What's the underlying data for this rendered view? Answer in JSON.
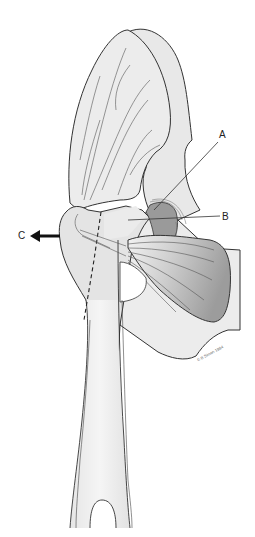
{
  "figure": {
    "labels": [
      {
        "id": "A",
        "text": "A",
        "x": 220,
        "y": 134
      },
      {
        "id": "B",
        "text": "B",
        "x": 222,
        "y": 212
      },
      {
        "id": "C",
        "text": "C",
        "x": 18,
        "y": 233
      }
    ],
    "arrow": {
      "direction": "left",
      "label": "C"
    },
    "copyright": "© B Simon 1984",
    "colors": {
      "outline": "#333333",
      "fill_light": "#ececec",
      "fill_mid": "#d8d8d8",
      "fill_dark": "#a8a8a8",
      "background": "#ffffff"
    }
  }
}
